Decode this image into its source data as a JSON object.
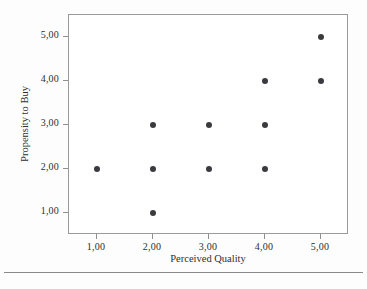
{
  "chart_data": {
    "type": "scatter",
    "title": "",
    "xlabel": "Perceived Quality",
    "ylabel": "Propensity to Buy",
    "xlim": [
      0.5,
      5.5
    ],
    "ylim": [
      0.5,
      5.5
    ],
    "grid": false,
    "legend": null,
    "marker": {
      "shape": "circle",
      "color": "#3b3b3f",
      "size_px": 6
    },
    "x_tick_labels": [
      "1,00",
      "2,00",
      "3,00",
      "4,00",
      "5,00"
    ],
    "y_tick_labels": [
      "1,00",
      "2,00",
      "3,00",
      "4,00",
      "5,00"
    ],
    "x_ticks": [
      1,
      2,
      3,
      4,
      5
    ],
    "y_ticks": [
      1,
      2,
      3,
      4,
      5
    ],
    "x": [
      1,
      2,
      2,
      2,
      3,
      3,
      4,
      4,
      4,
      5,
      5
    ],
    "y": [
      2,
      1,
      2,
      3,
      2,
      3,
      2,
      3,
      4,
      4,
      5
    ],
    "points": [
      {
        "x": 1,
        "y": 2
      },
      {
        "x": 2,
        "y": 1
      },
      {
        "x": 2,
        "y": 2
      },
      {
        "x": 2,
        "y": 3
      },
      {
        "x": 3,
        "y": 2
      },
      {
        "x": 3,
        "y": 3
      },
      {
        "x": 4,
        "y": 2
      },
      {
        "x": 4,
        "y": 3
      },
      {
        "x": 4,
        "y": 4
      },
      {
        "x": 5,
        "y": 4
      },
      {
        "x": 5,
        "y": 5
      }
    ]
  },
  "axes": {
    "frame_color": "#9a9a9a",
    "tick_color": "#8e8e8e",
    "text_color": "#2e2e2e"
  },
  "figure": {
    "background": "#fdfdfd",
    "plot_background": "#ffffff",
    "rule_color": "#8a8a8a"
  }
}
